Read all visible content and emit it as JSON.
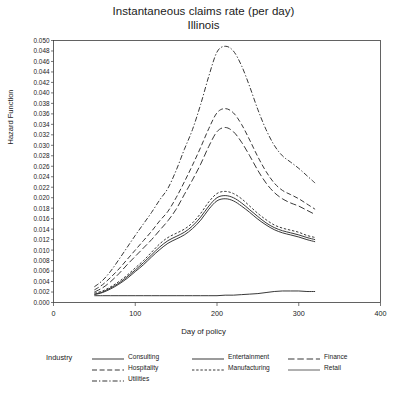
{
  "chart_data": {
    "type": "line",
    "title": "Instantaneous claims rate (per day)",
    "subtitle": "Illinois",
    "xlabel": "Day of policy",
    "ylabel": "Hazard Function",
    "xlim": [
      0,
      400
    ],
    "ylim": [
      0.0,
      0.05
    ],
    "xticks": [
      0,
      100,
      200,
      300,
      400
    ],
    "xtick_labels": [
      "0",
      "100",
      "200",
      "300",
      "400"
    ],
    "yticks": [
      0.0,
      0.002,
      0.004,
      0.006,
      0.008,
      0.01,
      0.012,
      0.014,
      0.016,
      0.018,
      0.02,
      0.022,
      0.024,
      0.026,
      0.028,
      0.03,
      0.032,
      0.034,
      0.036,
      0.038,
      0.04,
      0.042,
      0.044,
      0.046,
      0.048,
      0.05
    ],
    "ytick_labels": [
      "0.000",
      "0.002",
      "0.004",
      "0.006",
      "0.008",
      "0.010",
      "0.012",
      "0.014",
      "0.016",
      "0.018",
      "0.020",
      "0.022",
      "0.024",
      "0.026",
      "0.028",
      "0.030",
      "0.032",
      "0.034",
      "0.036",
      "0.038",
      "0.040",
      "0.042",
      "0.044",
      "0.046",
      "0.048",
      "0.050"
    ],
    "grid": false,
    "legend_title": "Industry",
    "legend_position": "bottom",
    "x": [
      50,
      60,
      70,
      80,
      90,
      100,
      110,
      120,
      130,
      140,
      150,
      160,
      170,
      180,
      190,
      200,
      210,
      220,
      230,
      240,
      250,
      260,
      270,
      280,
      290,
      300,
      310,
      320
    ],
    "series": [
      {
        "name": "Utilities",
        "dash": "dashdot",
        "values": [
          0.003,
          0.0042,
          0.006,
          0.0082,
          0.0105,
          0.0128,
          0.015,
          0.0172,
          0.0196,
          0.0218,
          0.0252,
          0.0292,
          0.033,
          0.0378,
          0.0432,
          0.0478,
          0.0489,
          0.048,
          0.0452,
          0.0412,
          0.0368,
          0.033,
          0.03,
          0.028,
          0.0268,
          0.0256,
          0.0242,
          0.0228
        ]
      },
      {
        "name": "Hospitality",
        "dash": "dash",
        "values": [
          0.0024,
          0.0034,
          0.0048,
          0.0064,
          0.0082,
          0.01,
          0.0118,
          0.0136,
          0.0156,
          0.0174,
          0.02,
          0.023,
          0.0262,
          0.0296,
          0.0332,
          0.0362,
          0.037,
          0.0362,
          0.034,
          0.031,
          0.0278,
          0.025,
          0.0228,
          0.0214,
          0.0206,
          0.0198,
          0.0188,
          0.0178
        ]
      },
      {
        "name": "Finance",
        "dash": "longdash",
        "values": [
          0.002,
          0.0028,
          0.004,
          0.0055,
          0.0072,
          0.0088,
          0.0104,
          0.012,
          0.0138,
          0.0156,
          0.0178,
          0.0206,
          0.0234,
          0.0264,
          0.0298,
          0.0326,
          0.0334,
          0.0326,
          0.0306,
          0.028,
          0.0252,
          0.0228,
          0.021,
          0.0198,
          0.019,
          0.0184,
          0.0176,
          0.0168
        ]
      },
      {
        "name": "Manufacturing",
        "dash": "shortdash-solid",
        "values": [
          0.0018,
          0.0022,
          0.003,
          0.004,
          0.0052,
          0.0066,
          0.008,
          0.0096,
          0.0112,
          0.0124,
          0.0132,
          0.014,
          0.0152,
          0.017,
          0.0192,
          0.0208,
          0.0212,
          0.0208,
          0.0198,
          0.0184,
          0.017,
          0.0158,
          0.0148,
          0.0142,
          0.0138,
          0.0134,
          0.0128,
          0.0124
        ]
      },
      {
        "name": "Entertainment",
        "dash": "solid",
        "values": [
          0.0016,
          0.002,
          0.0028,
          0.0037,
          0.0049,
          0.0062,
          0.0076,
          0.0091,
          0.0106,
          0.0118,
          0.0126,
          0.0134,
          0.0146,
          0.0163,
          0.0184,
          0.02,
          0.0204,
          0.02,
          0.019,
          0.0177,
          0.0164,
          0.0152,
          0.0143,
          0.0137,
          0.0133,
          0.0129,
          0.0124,
          0.012
        ]
      },
      {
        "name": "Retail",
        "dash": "solid-thin",
        "values": [
          0.0015,
          0.0019,
          0.0026,
          0.0035,
          0.0046,
          0.0059,
          0.0072,
          0.0087,
          0.0101,
          0.0113,
          0.0121,
          0.0129,
          0.0141,
          0.0157,
          0.0178,
          0.0194,
          0.0198,
          0.0194,
          0.0184,
          0.0172,
          0.0159,
          0.0148,
          0.0139,
          0.0133,
          0.0129,
          0.0125,
          0.012,
          0.0116
        ]
      },
      {
        "name": "Consulting",
        "dash": "solid",
        "values": [
          0.0013,
          0.0013,
          0.0013,
          0.0013,
          0.0013,
          0.0013,
          0.0013,
          0.0013,
          0.0013,
          0.0013,
          0.0013,
          0.0013,
          0.0013,
          0.0013,
          0.0013,
          0.0013,
          0.0014,
          0.0014,
          0.0015,
          0.0016,
          0.0017,
          0.0019,
          0.0021,
          0.0022,
          0.0022,
          0.0022,
          0.0021,
          0.0021
        ]
      }
    ],
    "legend_entries": [
      {
        "label": "Consulting",
        "dash": "solid",
        "col": 0,
        "row": 0
      },
      {
        "label": "Hospitality",
        "dash": "dash",
        "col": 0,
        "row": 1
      },
      {
        "label": "Utilities",
        "dash": "dashdot",
        "col": 0,
        "row": 2
      },
      {
        "label": "Entertainment",
        "dash": "solid",
        "col": 1,
        "row": 0
      },
      {
        "label": "Manufacturing",
        "dash": "shortdash-solid",
        "col": 1,
        "row": 1
      },
      {
        "label": "Finance",
        "dash": "longdash",
        "col": 2,
        "row": 0
      },
      {
        "label": "Retail",
        "dash": "solid-thin",
        "col": 2,
        "row": 1
      }
    ]
  }
}
